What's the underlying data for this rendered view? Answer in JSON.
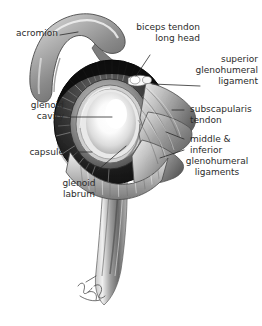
{
  "figure": {
    "background_color": "#ffffff",
    "ink_color": "#2b2b2b",
    "style": "grayscale medical illustration"
  },
  "labels": {
    "acromion": "acromion",
    "biceps_tendon": "biceps tendon\nlong head",
    "superior_glenohumeral_ligament": "superior\nglenohumeral\nligament",
    "glenoid_cavity": "glenoid\ncavity",
    "subscapularis_tendon": "subscapularis\ntendon",
    "capsule": "capsule",
    "middle_inferior_line1": "middle &",
    "middle_inferior_line2": "inferior",
    "middle_inferior_line3": "glenohumeral\nligaments",
    "glenoid_labrum": "glenoid\nlabrum"
  },
  "signature": {
    "text": "artist signature",
    "visible": true
  },
  "structures": [
    {
      "name": "acromion",
      "tone": "#8d8d8d"
    },
    {
      "name": "capsule-rim",
      "tone": "#141414"
    },
    {
      "name": "glenoid-cavity",
      "tone": "#fdfdfd"
    },
    {
      "name": "glenoid-labrum",
      "tone": "#6f6f6f"
    },
    {
      "name": "subscapularis-tendon",
      "tone": "#a5a5a5"
    },
    {
      "name": "humerus-shaft",
      "tone": "#9a9a9a"
    },
    {
      "name": "biceps-tendon-long-head",
      "tone": "#f2f2f2"
    }
  ]
}
